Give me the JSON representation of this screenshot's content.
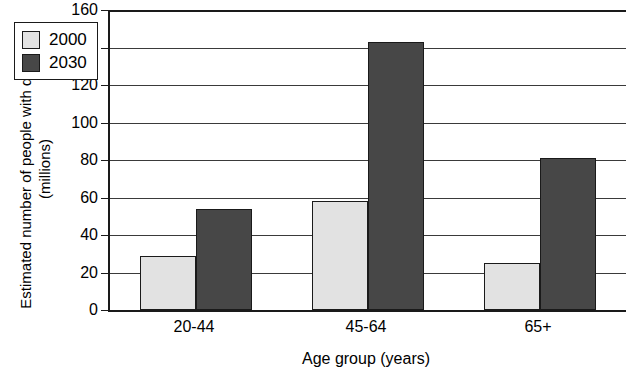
{
  "chart_data": {
    "type": "bar",
    "title": "",
    "xlabel": "Age group (years)",
    "ylabel": "Estimated number of people with diabetes (millions)",
    "categories": [
      "20-44",
      "45-64",
      "65+"
    ],
    "series": [
      {
        "name": "2000",
        "color": "#e2e2e2",
        "values": [
          29,
          58,
          25
        ]
      },
      {
        "name": "2030",
        "color": "#474747",
        "values": [
          54,
          143,
          81
        ]
      }
    ],
    "ylim": [
      0,
      160
    ],
    "ytick_step": 20,
    "yticks": [
      "0",
      "20",
      "40",
      "60",
      "80",
      "100",
      "120",
      "140",
      "160"
    ],
    "grid": true,
    "grid_axis": "y",
    "legend_position": "upper-left-inside",
    "legend_entries": [
      "2000",
      "2030"
    ],
    "bar_border_color": "#1a1a1a",
    "axis_color": "#1a1a1a"
  },
  "axes": {
    "y_title": "Estimated number of people with diabetes (millions)",
    "x_title": "Age group (years)"
  },
  "legend": {
    "items": [
      {
        "label": "2000"
      },
      {
        "label": "2030"
      }
    ]
  }
}
